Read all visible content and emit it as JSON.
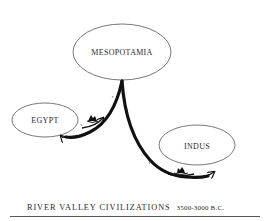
{
  "diagram": {
    "nodes": [
      {
        "id": "mesopotamia",
        "label": "MESOPOTAMIA",
        "cx": 122,
        "cy": 52,
        "rx": 49,
        "ry": 28
      },
      {
        "id": "egypt",
        "label": "EGYPT",
        "cx": 45,
        "cy": 120,
        "rx": 33,
        "ry": 17
      },
      {
        "id": "indus",
        "label": "INDUS",
        "cx": 197,
        "cy": 145,
        "rx": 38,
        "ry": 20
      }
    ],
    "edges": [
      {
        "from": "mesopotamia",
        "to": "egypt",
        "style": "thick-curve-arrow",
        "icon": "boat-icon"
      },
      {
        "from": "mesopotamia",
        "to": "indus",
        "style": "thick-curve-arrow",
        "icon": "boat-icon"
      }
    ],
    "caption": {
      "title": "RIVER VALLEY CIVILIZATIONS",
      "dates": "3500-3000 B.C."
    },
    "colors": {
      "ink": "#111111",
      "ellipse_stroke": "#555555",
      "text": "#2a2a2a",
      "background": "#ffffff"
    }
  }
}
